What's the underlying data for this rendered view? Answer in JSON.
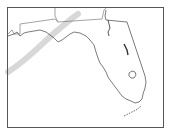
{
  "map": {
    "region": "Florida",
    "colors": {
      "background": "#ffffff",
      "frame": "#555555",
      "coastline": "#444444",
      "state_border": "#555555",
      "track": "#d6d6d6"
    },
    "features": [
      "frame",
      "state-borders",
      "florida-coastline",
      "lake-okeechobee",
      "florida-keys",
      "storm-track-arc"
    ]
  }
}
